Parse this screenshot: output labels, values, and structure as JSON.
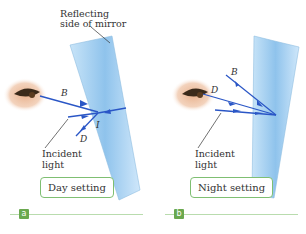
{
  "mirror_label": {
    "line1": "Reflecting",
    "line2": "side of mirror"
  },
  "panels": [
    {
      "id": "a",
      "badge": "a",
      "setting": "Day setting",
      "ray_labels": {
        "B": "B",
        "D": "D",
        "I": "I"
      },
      "incident": {
        "line1": "Incident",
        "line2": "light"
      }
    },
    {
      "id": "b",
      "badge": "b",
      "setting": "Night setting",
      "ray_labels": {
        "B": "B",
        "D": "D"
      },
      "incident": {
        "line1": "Incident",
        "line2": "light"
      }
    }
  ],
  "colors": {
    "ray": "#2a56c6",
    "mirror": "#a9d2f2",
    "accent": "#6aa84f",
    "callout_border": "#7fbf72"
  }
}
